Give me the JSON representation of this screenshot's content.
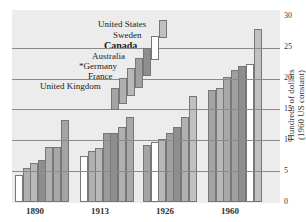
{
  "chart_data": {
    "type": "bar",
    "title": "",
    "xlabel": "",
    "ylabel": "Hundreds of dollars (1960 US constant)",
    "ylim": [
      0,
      30
    ],
    "yticks": [
      0,
      5,
      10,
      15,
      20,
      25,
      30
    ],
    "categories": [
      "1890",
      "1913",
      "1926",
      "1960"
    ],
    "legend": [
      "United Kingdom",
      "France",
      "*Germany",
      "Australia",
      "Canada",
      "Sweden",
      "United States"
    ],
    "series_sorted_note": "Within each year bars are sorted ascending by value",
    "bars_by_year": {
      "1890": [
        4.4,
        5.5,
        6.3,
        6.8,
        8.9,
        8.9,
        13.3
      ],
      "1913": [
        7.5,
        8.3,
        8.7,
        11.2,
        11.2,
        12.2,
        13.8
      ],
      "1926": [
        9.2,
        9.7,
        10.2,
        11.2,
        12.2,
        13.8,
        17.2
      ],
      "1960": [
        18.2,
        18.5,
        20.3,
        21.4,
        22.0,
        22.4,
        28.0
      ]
    },
    "legend_position": "top-left stepped"
  },
  "axis": {
    "ticks": [
      "0",
      "5",
      "10",
      "15",
      "20",
      "25",
      "30"
    ],
    "label1": "Hundreds of dollars",
    "label2": "(1960 US constant)"
  },
  "legend": {
    "items": [
      "United States",
      "Sweden",
      "Canada",
      "Australia",
      "*Germany",
      "France",
      "United Kingdom"
    ]
  },
  "xcats": [
    "1890",
    "1913",
    "1926",
    "1960"
  ]
}
